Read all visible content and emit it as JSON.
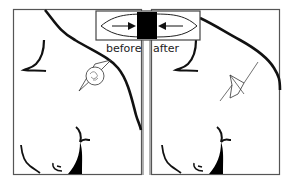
{
  "figure": {
    "labels": {
      "before": "before",
      "after": "after"
    },
    "inset": {
      "description": "lens shape with arrows pointing inward to black bar",
      "icon": "compression-arrows-icon"
    },
    "panels": [
      {
        "id": "left",
        "label_ref": "before",
        "marker": "diamond-with-circle"
      },
      {
        "id": "right",
        "label_ref": "after",
        "marker": "diamond-with-lines"
      }
    ],
    "colors": {
      "stroke": "#111111",
      "border": "#555555",
      "fill": "#000000",
      "background": "#ffffff"
    }
  }
}
